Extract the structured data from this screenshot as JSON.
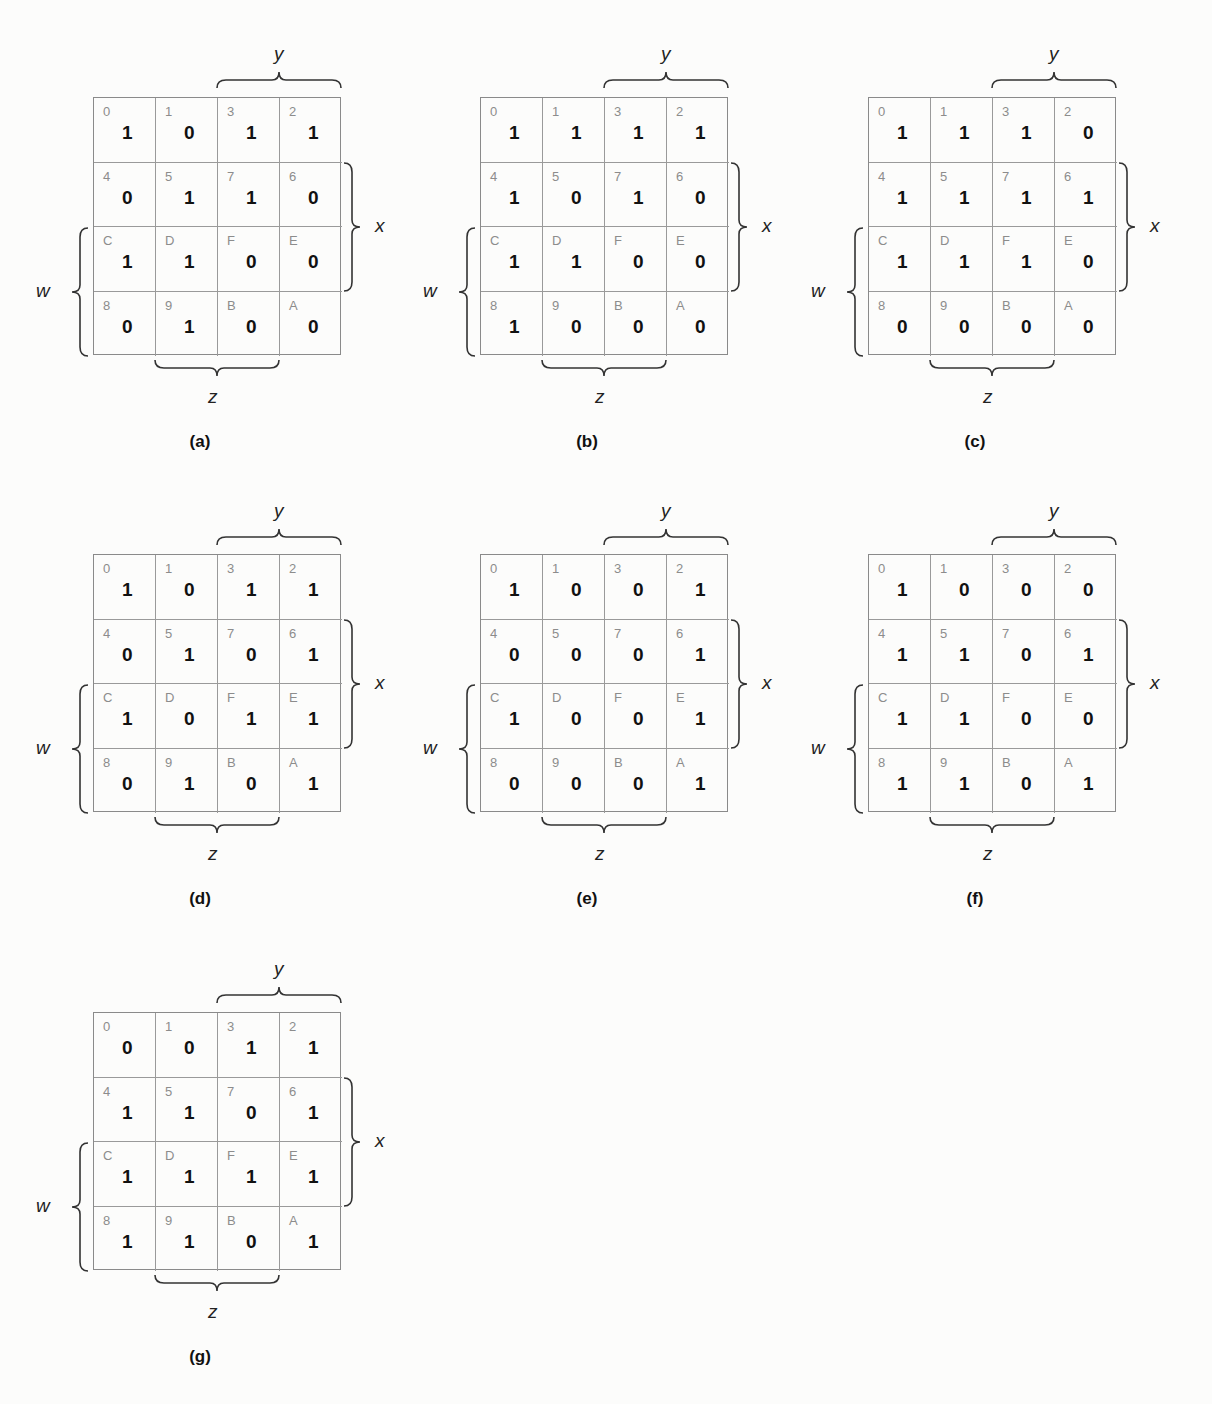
{
  "figure": {
    "variables": {
      "top": "y",
      "right": "x",
      "left": "w",
      "bottom": "z"
    },
    "cell_order": [
      "0",
      "1",
      "3",
      "2",
      "4",
      "5",
      "7",
      "6",
      "C",
      "D",
      "F",
      "E",
      "8",
      "9",
      "B",
      "A"
    ],
    "maps": [
      {
        "label": "(a)",
        "values": [
          "1",
          "0",
          "1",
          "1",
          "0",
          "1",
          "1",
          "0",
          "1",
          "1",
          "0",
          "0",
          "0",
          "1",
          "0",
          "0"
        ]
      },
      {
        "label": "(b)",
        "values": [
          "1",
          "1",
          "1",
          "1",
          "1",
          "0",
          "1",
          "0",
          "1",
          "1",
          "0",
          "0",
          "1",
          "0",
          "0",
          "0"
        ]
      },
      {
        "label": "(c)",
        "values": [
          "1",
          "1",
          "1",
          "0",
          "1",
          "1",
          "1",
          "1",
          "1",
          "1",
          "1",
          "0",
          "0",
          "0",
          "0",
          "0"
        ]
      },
      {
        "label": "(d)",
        "values": [
          "1",
          "0",
          "1",
          "1",
          "0",
          "1",
          "0",
          "1",
          "1",
          "0",
          "1",
          "1",
          "0",
          "1",
          "0",
          "1"
        ]
      },
      {
        "label": "(e)",
        "values": [
          "1",
          "0",
          "0",
          "1",
          "0",
          "0",
          "0",
          "1",
          "1",
          "0",
          "0",
          "1",
          "0",
          "0",
          "0",
          "1"
        ]
      },
      {
        "label": "(f)",
        "values": [
          "1",
          "0",
          "0",
          "0",
          "1",
          "1",
          "0",
          "1",
          "1",
          "1",
          "0",
          "0",
          "1",
          "1",
          "0",
          "1"
        ]
      },
      {
        "label": "(g)",
        "values": [
          "0",
          "0",
          "1",
          "1",
          "1",
          "1",
          "0",
          "1",
          "1",
          "1",
          "1",
          "1",
          "1",
          "1",
          "0",
          "1"
        ]
      }
    ]
  }
}
